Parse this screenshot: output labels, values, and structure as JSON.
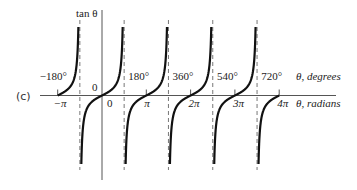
{
  "chart_data": {
    "type": "line",
    "title": "",
    "panel_label": "(c)",
    "function": "tan θ",
    "ylabel": "tan θ",
    "xlabel_degrees": "θ, degrees",
    "xlabel_radians": "θ, radians",
    "x_degree_ticks": [
      {
        "value": -180,
        "label": "−180°"
      },
      {
        "value": 180,
        "label": "180°"
      },
      {
        "value": 360,
        "label": "360°"
      },
      {
        "value": 540,
        "label": "540°"
      },
      {
        "value": 720,
        "label": "720°"
      }
    ],
    "x_radian_ticks": [
      {
        "value": -180,
        "label": "−π"
      },
      {
        "value": 0,
        "label": "0"
      },
      {
        "value": 180,
        "label": "π"
      },
      {
        "value": 360,
        "label": "2π"
      },
      {
        "value": 540,
        "label": "3π"
      },
      {
        "value": 720,
        "label": "4π"
      }
    ],
    "origin_label": "0",
    "asymptotes_degrees": [
      -90,
      90,
      270,
      450,
      630
    ],
    "branches": [
      {
        "from": -180,
        "to": -90
      },
      {
        "from": -90,
        "to": 90
      },
      {
        "from": 90,
        "to": 270
      },
      {
        "from": 270,
        "to": 450
      },
      {
        "from": 450,
        "to": 630
      },
      {
        "from": 630,
        "to": 720
      }
    ],
    "xlim_degrees": [
      -205,
      790
    ],
    "ylim": [
      -8,
      8
    ],
    "grid": false,
    "legend": "none",
    "colors": {
      "curve": "#111111",
      "axis": "#555555",
      "asymptote": "#777777"
    }
  }
}
